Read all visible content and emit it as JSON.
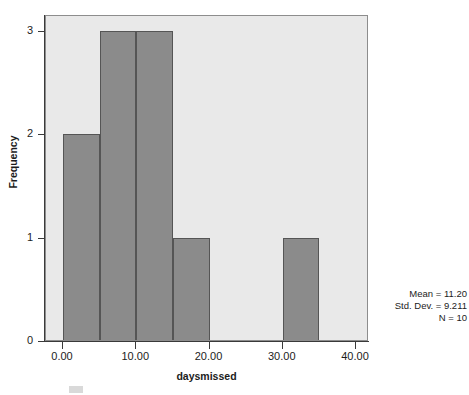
{
  "chart_data": {
    "type": "bar",
    "title": "",
    "subtitle": "",
    "xlabel": "daysmissed",
    "ylabel": "Frequency",
    "xlim": [
      -3,
      43
    ],
    "ylim": [
      0,
      3.17
    ],
    "grid": false,
    "legend": "none",
    "bin_width": 5,
    "bins": [
      {
        "label": "0-5",
        "x_start": 0,
        "x_end": 5,
        "value": 2
      },
      {
        "label": "5-10",
        "x_start": 5,
        "x_end": 10,
        "value": 3
      },
      {
        "label": "10-15",
        "x_start": 10,
        "x_end": 15,
        "value": 3
      },
      {
        "label": "15-20",
        "x_start": 15,
        "x_end": 20,
        "value": 1
      },
      {
        "label": "20-25",
        "x_start": 20,
        "x_end": 25,
        "value": 0
      },
      {
        "label": "25-30",
        "x_start": 25,
        "x_end": 30,
        "value": 0
      },
      {
        "label": "30-35",
        "x_start": 30,
        "x_end": 35,
        "value": 1
      }
    ],
    "categories": [
      "0-5",
      "5-10",
      "10-15",
      "15-20",
      "20-25",
      "25-30",
      "30-35"
    ],
    "values": [
      2,
      3,
      3,
      1,
      0,
      0,
      1
    ],
    "x_ticks": [
      {
        "value": 0,
        "label": "0.00"
      },
      {
        "value": 10,
        "label": "10.00"
      },
      {
        "value": 20,
        "label": "20.00"
      },
      {
        "value": 30,
        "label": "30.00"
      },
      {
        "value": 40,
        "label": "40.00"
      }
    ],
    "y_ticks": [
      {
        "value": 0,
        "label": "0"
      },
      {
        "value": 1,
        "label": "1"
      },
      {
        "value": 2,
        "label": "2"
      },
      {
        "value": 3,
        "label": "3"
      }
    ],
    "annotations": {
      "mean": "Mean = 11.20",
      "std_dev": "Std. Dev. = 9.211",
      "n": "N = 10"
    },
    "colors": {
      "bar_fill": "#8b8b8b",
      "bar_edge": "#555555",
      "plot_background": "#e9e9e9",
      "figure_background": "#ffffff",
      "axis": "#3a3a3a",
      "text": "#1c1c1c"
    }
  }
}
